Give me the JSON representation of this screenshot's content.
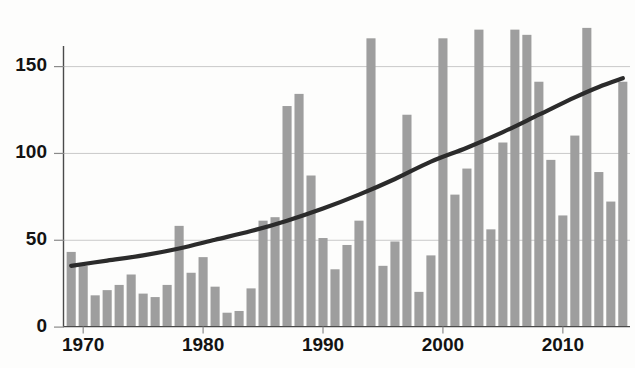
{
  "chart_data": {
    "type": "bar",
    "title": "",
    "subtitle": "",
    "xlabel": "",
    "ylabel": "",
    "xlim": [
      1968.4,
      2015.6
    ],
    "ylim": [
      0,
      180
    ],
    "grid": true,
    "legend": null,
    "bar_color": "#9e9e9e",
    "trend_color": "#2b2b2b",
    "yticks": [
      0,
      50,
      100,
      150
    ],
    "ytick_labels": [
      "0",
      "50",
      "100",
      "150"
    ],
    "xticks": [
      1970,
      1980,
      1990,
      2000,
      2010
    ],
    "xtick_labels": [
      "1970",
      "1980",
      "1990",
      "2000",
      "2010"
    ],
    "categories": [
      1969,
      1970,
      1971,
      1972,
      1973,
      1974,
      1975,
      1976,
      1977,
      1978,
      1979,
      1980,
      1981,
      1982,
      1983,
      1984,
      1985,
      1986,
      1987,
      1988,
      1989,
      1990,
      1991,
      1992,
      1993,
      1994,
      1995,
      1996,
      1997,
      1998,
      1999,
      2000,
      2001,
      2002,
      2003,
      2004,
      2005,
      2006,
      2007,
      2008,
      2009,
      2010,
      2011,
      2012,
      2013,
      2014,
      2015
    ],
    "values": [
      43,
      35,
      18,
      21,
      24,
      30,
      19,
      17,
      24,
      58,
      31,
      40,
      23,
      8,
      9,
      22,
      61,
      63,
      127,
      134,
      87,
      51,
      33,
      47,
      61,
      166,
      35,
      49,
      122,
      20,
      41,
      166,
      76,
      91,
      171,
      56,
      106,
      171,
      168,
      141,
      96,
      64,
      110,
      172,
      89,
      72,
      141
    ],
    "series": [
      {
        "name": "annual-count",
        "type": "bar",
        "values": [
          43,
          35,
          18,
          21,
          24,
          30,
          19,
          17,
          24,
          58,
          31,
          40,
          23,
          8,
          9,
          22,
          61,
          63,
          127,
          134,
          87,
          51,
          33,
          47,
          61,
          166,
          35,
          49,
          122,
          20,
          41,
          166,
          76,
          91,
          171,
          56,
          106,
          171,
          168,
          141,
          96,
          64,
          110,
          172,
          89,
          72,
          141
        ]
      },
      {
        "name": "trend-curve",
        "type": "line",
        "x": [
          1969,
          1972,
          1975,
          1978,
          1981,
          1984,
          1987,
          1990,
          1993,
          1996,
          1999,
          2002,
          2005,
          2008,
          2011,
          2013,
          2015
        ],
        "values": [
          35,
          38,
          41,
          45,
          50,
          55,
          61,
          68,
          76,
          85,
          95,
          103,
          112,
          122,
          132,
          138,
          143
        ]
      }
    ]
  }
}
